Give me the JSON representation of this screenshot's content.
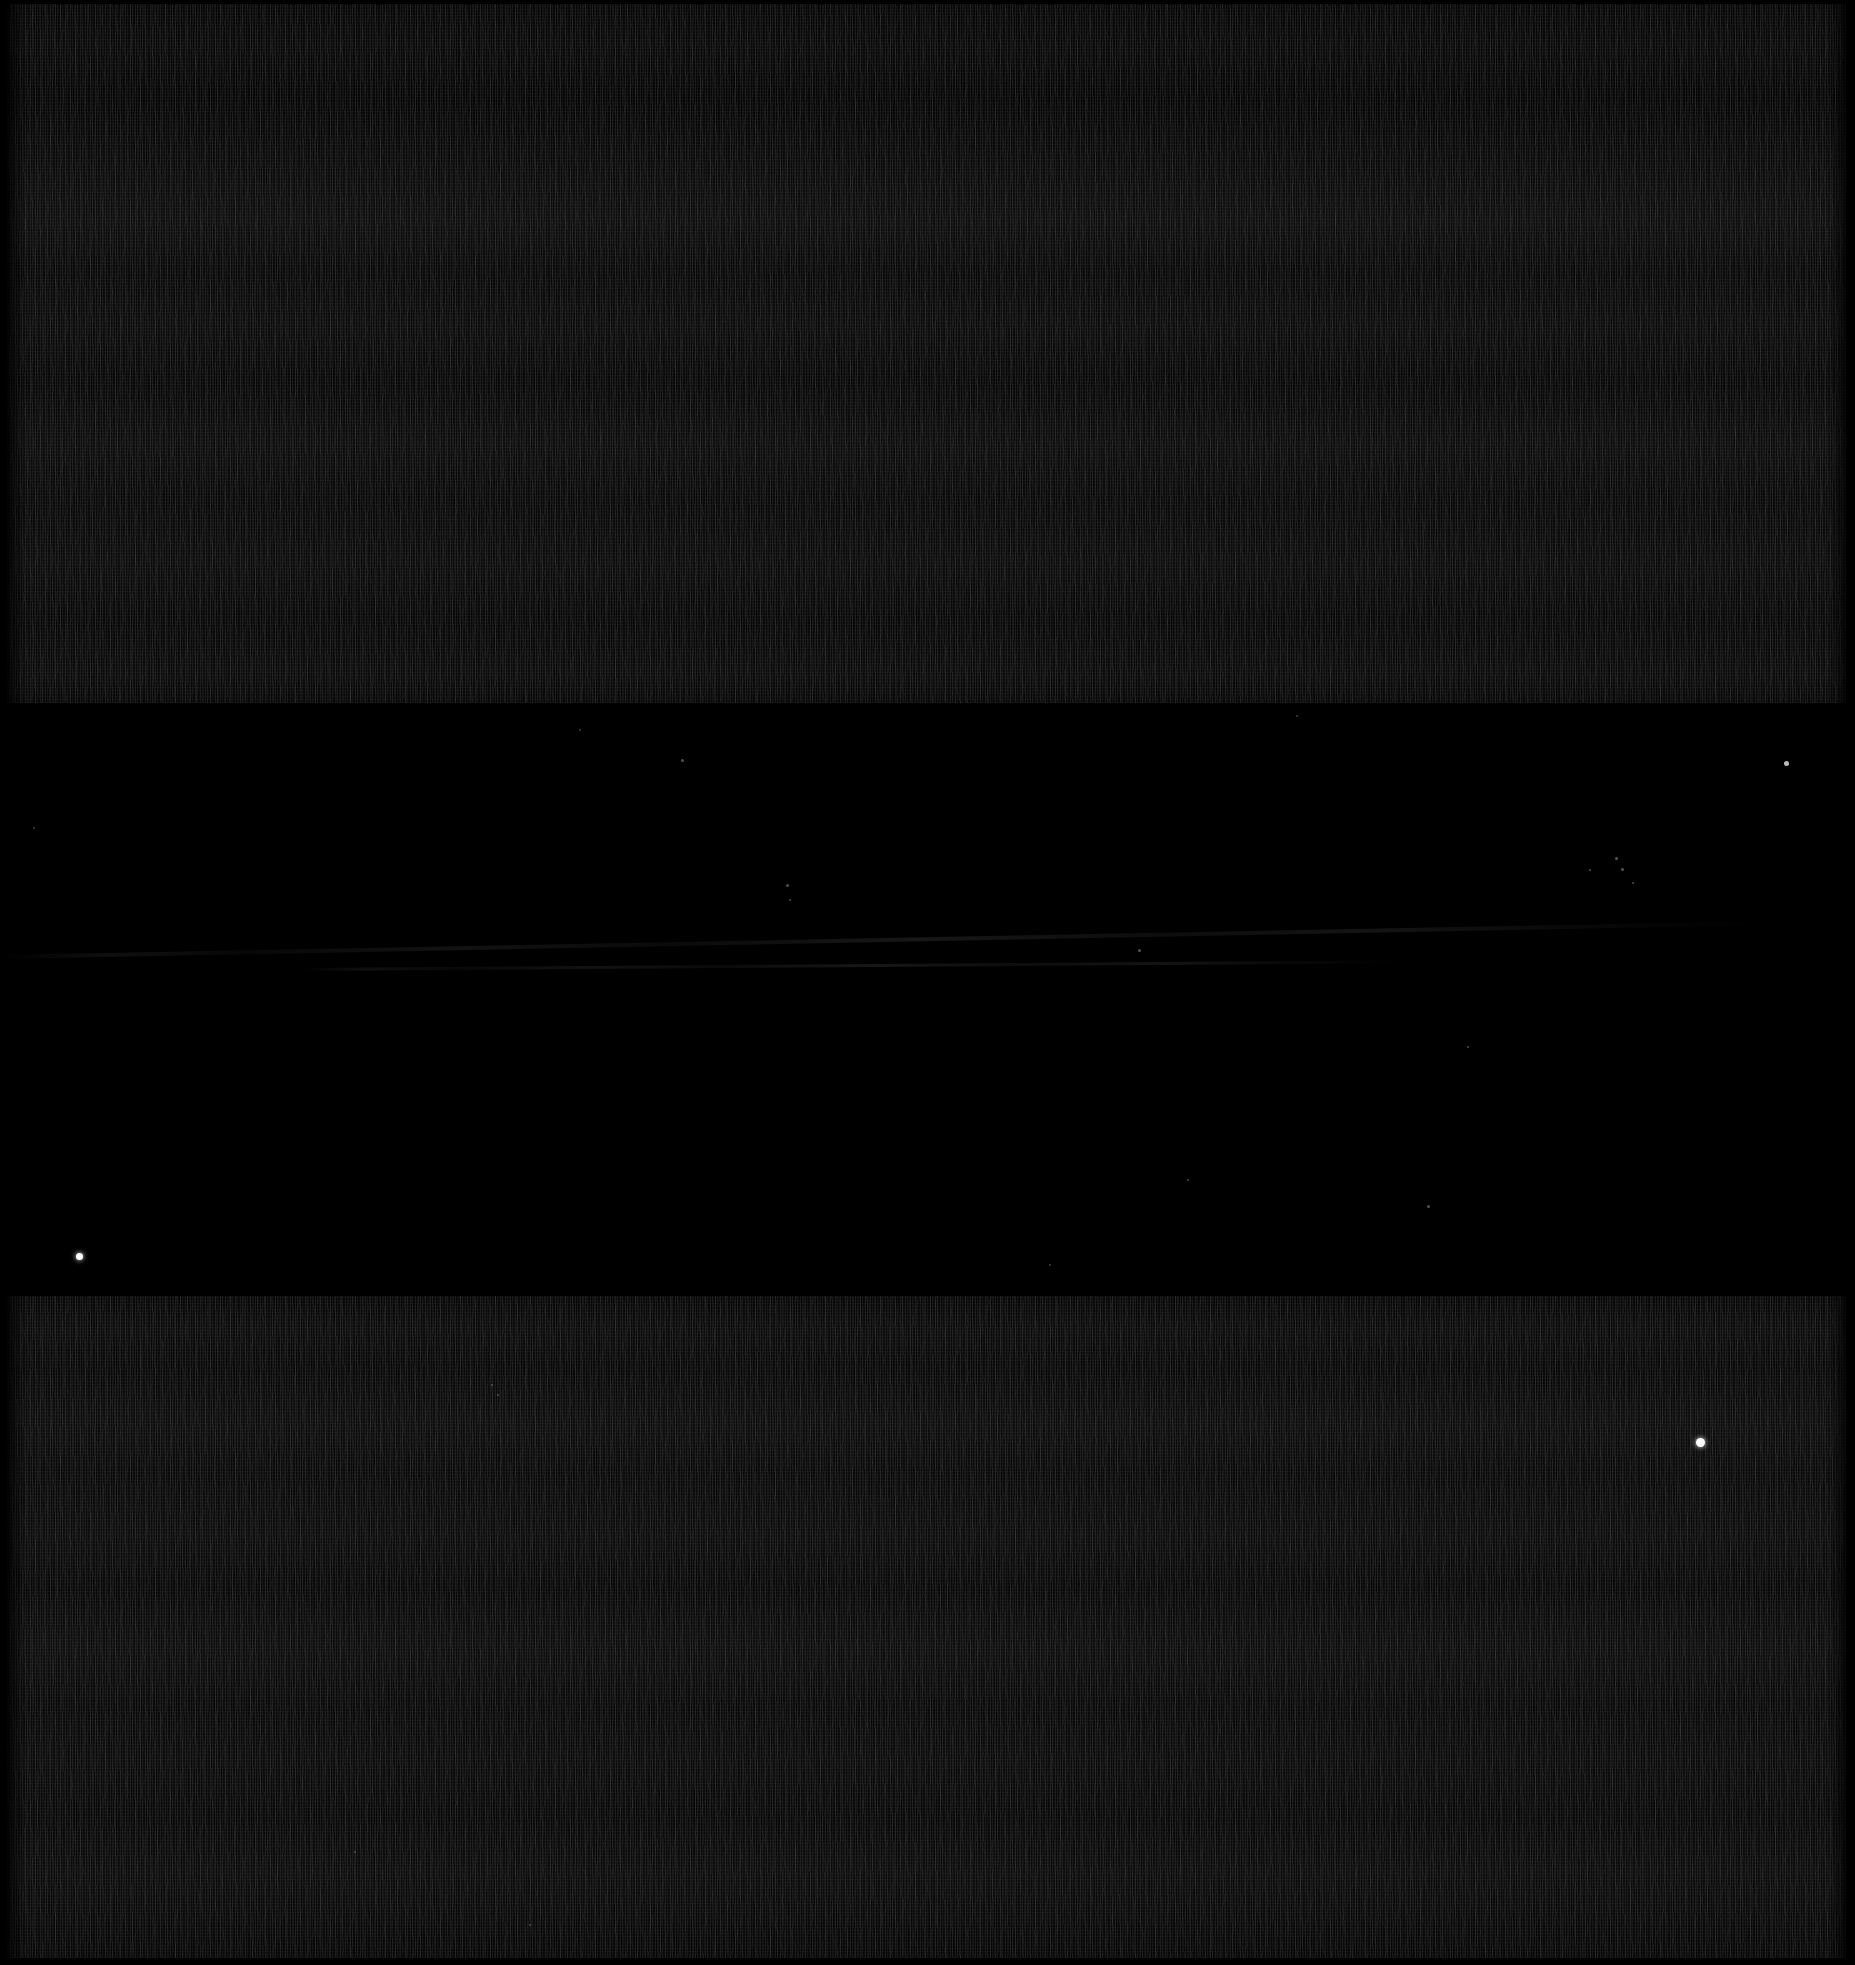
{
  "image": {
    "title": "Astronomical detector frame",
    "description": "Near-black wide-field exposure composed of three horizontal bands: two noisy dark-gray detector strips separated by a pure black sky gap containing faint point sources.",
    "width": 1855,
    "height": 1965,
    "background_color": "#000000"
  },
  "bands": [
    {
      "id": "top-detector-strip",
      "label": "Upper detector strip",
      "type": "noise",
      "top": 4,
      "height": 699,
      "base_color": "#0c0c0c",
      "mean_level": 13,
      "texture": "horizontal scan-line grain"
    },
    {
      "id": "sky-gap",
      "label": "Sky gap",
      "type": "sky",
      "top": 703,
      "height": 593,
      "base_color": "#000000",
      "mean_level": 2,
      "texture": "clean black with point sources"
    },
    {
      "id": "bottom-detector-strip",
      "label": "Lower detector strip",
      "type": "noise",
      "top": 1296,
      "height": 662,
      "base_color": "#0d0d0d",
      "mean_level": 14,
      "texture": "horizontal scan-line grain"
    }
  ],
  "point_sources": [
    {
      "name": "star-bright-lower-right",
      "x": 1700,
      "y": 1442,
      "size": 9,
      "brightness": "bright",
      "color": "#ffffff"
    },
    {
      "name": "star-bright-gap-left",
      "x": 79,
      "y": 1256,
      "size": 7,
      "brightness": "bright",
      "color": "#ffffff"
    },
    {
      "name": "star-gap-right-upper",
      "x": 1786,
      "y": 763,
      "size": 5,
      "brightness": "medium",
      "color": "#e8e8e8"
    },
    {
      "name": "star-gap-center-a",
      "x": 1616,
      "y": 858,
      "size": 3,
      "brightness": "faint",
      "color": "#cfcfcf"
    },
    {
      "name": "star-gap-center-b",
      "x": 1622,
      "y": 869,
      "size": 3,
      "brightness": "faint",
      "color": "#cfcfcf"
    },
    {
      "name": "star-gap-center-c",
      "x": 1633,
      "y": 883,
      "size": 2,
      "brightness": "faint",
      "color": "#bdbdbd"
    },
    {
      "name": "star-gap-center-d",
      "x": 1590,
      "y": 870,
      "size": 2,
      "brightness": "faint",
      "color": "#bdbdbd"
    },
    {
      "name": "star-gap-left-a",
      "x": 682,
      "y": 760,
      "size": 3,
      "brightness": "faint",
      "color": "#c8c8c8"
    },
    {
      "name": "star-gap-left-b",
      "x": 787,
      "y": 885,
      "size": 3,
      "brightness": "faint",
      "color": "#c0c0c0"
    },
    {
      "name": "star-gap-left-c",
      "x": 790,
      "y": 900,
      "size": 2,
      "brightness": "faint",
      "color": "#b4b4b4"
    },
    {
      "name": "star-gap-mid-a",
      "x": 1139,
      "y": 950,
      "size": 3,
      "brightness": "faint",
      "color": "#c4c4c4"
    },
    {
      "name": "star-gap-mid-b",
      "x": 1468,
      "y": 1047,
      "size": 2,
      "brightness": "faint",
      "color": "#b0b0b0"
    },
    {
      "name": "star-gap-mid-c",
      "x": 1188,
      "y": 1180,
      "size": 2,
      "brightness": "faint",
      "color": "#b0b0b0"
    },
    {
      "name": "star-gap-right-b",
      "x": 1428,
      "y": 1206,
      "size": 3,
      "brightness": "faint",
      "color": "#bcbcbc"
    },
    {
      "name": "star-gap-lower-a",
      "x": 492,
      "y": 1385,
      "size": 2,
      "brightness": "faint",
      "color": "#a8a8a8"
    },
    {
      "name": "star-gap-lower-b",
      "x": 498,
      "y": 1395,
      "size": 2,
      "brightness": "faint",
      "color": "#a8a8a8"
    },
    {
      "name": "star-gap-top-a",
      "x": 580,
      "y": 730,
      "size": 2,
      "brightness": "faint",
      "color": "#a0a0a0"
    },
    {
      "name": "star-gap-top-b",
      "x": 1297,
      "y": 716,
      "size": 2,
      "brightness": "faint",
      "color": "#a0a0a0"
    },
    {
      "name": "star-gap-top-c",
      "x": 34,
      "y": 828,
      "size": 2,
      "brightness": "faint",
      "color": "#9a9a9a"
    },
    {
      "name": "star-gap-bottom-a",
      "x": 1050,
      "y": 1265,
      "size": 2,
      "brightness": "faint",
      "color": "#9a9a9a"
    },
    {
      "name": "star-strip-bottom-a",
      "x": 355,
      "y": 1852,
      "size": 2,
      "brightness": "faint",
      "color": "#969696"
    },
    {
      "name": "star-strip-bottom-b",
      "x": 530,
      "y": 1925,
      "size": 2,
      "brightness": "faint",
      "color": "#969696"
    }
  ],
  "streaks": [
    {
      "name": "faint-diagonal-streak",
      "description": "Low-contrast diagonal streak crossing the sky gap from lower-left to upper-right",
      "x": 0,
      "y": 955,
      "width": 1760,
      "height": 4,
      "rotation_deg": -1.1
    },
    {
      "name": "faint-horizontal-wisp",
      "description": "Very faint horizontal wisp just below the main streak",
      "x": 300,
      "y": 968,
      "width": 1100,
      "height": 3,
      "rotation_deg": -0.4
    }
  ],
  "borders": {
    "top_px": 4,
    "bottom_px": 6,
    "left_px": 5,
    "right_px": 9,
    "color": "#000000"
  }
}
